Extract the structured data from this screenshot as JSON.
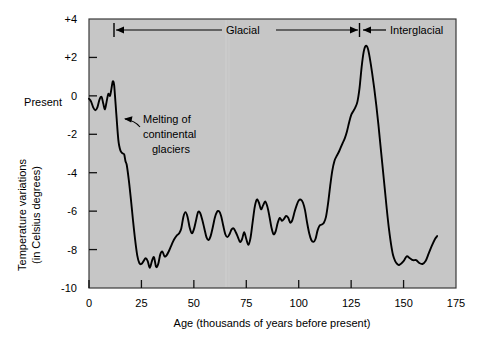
{
  "figure": {
    "plot_background_color": "#c6c6c6",
    "frame_color": "#333333",
    "curve_color": "#000000",
    "present_label": "Present",
    "annotation": {
      "line1": "Melting of",
      "line2": "continental",
      "line3": "glaciers"
    },
    "bands": [
      {
        "label": "Glacial",
        "start": 11,
        "end": 128
      },
      {
        "label": "Interglacial",
        "start": 128,
        "end": 175
      }
    ]
  },
  "chart_data": {
    "type": "line",
    "title": "",
    "xlabel": "Age (thousands of years before present)",
    "ylabel_line1": "Temperature variations",
    "ylabel_line2": "(in Celsius degrees)",
    "xlim": [
      0,
      175
    ],
    "ylim": [
      -10,
      4
    ],
    "xticks": [
      0,
      25,
      50,
      75,
      100,
      125,
      150,
      175
    ],
    "xticklabels": [
      "0",
      "25",
      "50",
      "75",
      "100",
      "125",
      "150",
      "175"
    ],
    "yticks": [
      -10,
      -8,
      -6,
      -4,
      -2,
      0,
      2,
      4
    ],
    "yticklabels": [
      "-10",
      "-8",
      "-6",
      "-4",
      "-2",
      "0",
      "+2",
      "+4"
    ],
    "grid": false,
    "legend": null,
    "series": [
      {
        "name": "Temperature variation",
        "x": [
          0.0,
          1.0,
          2.0,
          3.0,
          4.0,
          5.0,
          6.0,
          6.8,
          7.6,
          8.4,
          9.2,
          10.0,
          10.6,
          11.2,
          11.6,
          12.0,
          12.4,
          12.8,
          13.2,
          13.6,
          14.0,
          14.4,
          15.0,
          15.6,
          16.2,
          16.8,
          17.4,
          18.0,
          19.0,
          20.0,
          21.0,
          22.0,
          23.0,
          24.0,
          25.0,
          26.0,
          27.0,
          28.0,
          29.0,
          30.0,
          31.0,
          32.0,
          33.0,
          34.0,
          35.0,
          36.0,
          37.0,
          38.0,
          39.0,
          40.0,
          41.0,
          42.0,
          43.0,
          44.0,
          45.0,
          46.0,
          47.0,
          48.0,
          49.0,
          50.0,
          51.0,
          52.0,
          53.0,
          54.0,
          55.0,
          56.0,
          57.0,
          58.0,
          59.0,
          60.0,
          61.0,
          62.0,
          63.0,
          64.0,
          65.0,
          66.0,
          67.0,
          68.0,
          69.0,
          70.0,
          71.0,
          72.0,
          73.0,
          74.0,
          75.0,
          76.0,
          77.0,
          78.0,
          79.0,
          80.0,
          81.0,
          82.0,
          83.0,
          84.0,
          85.0,
          86.0,
          87.0,
          88.0,
          89.0,
          90.0,
          91.0,
          92.0,
          93.0,
          94.0,
          95.0,
          96.0,
          97.0,
          98.0,
          99.0,
          100.0,
          101.0,
          102.0,
          103.0,
          104.0,
          105.0,
          106.0,
          107.0,
          108.0,
          109.0,
          110.0,
          111.0,
          112.0,
          113.0,
          114.0,
          115.0,
          116.0,
          117.0,
          118.0,
          119.0,
          120.0,
          121.0,
          122.0,
          123.0,
          124.0,
          125.0,
          126.0,
          127.0,
          128.0,
          129.0,
          130.0,
          131.0,
          132.0,
          133.0,
          134.0,
          135.0,
          136.0,
          137.0,
          138.0,
          139.0,
          140.0,
          141.0,
          142.0,
          143.0,
          144.0,
          145.0,
          146.0,
          147.0,
          148.0,
          150.0,
          151.5,
          153.0,
          154.5,
          156.0,
          157.5,
          159.0,
          160.5,
          162.0,
          163.5,
          165.0,
          166.0
        ],
        "y": [
          -0.15,
          -0.3,
          -0.6,
          -0.75,
          -0.6,
          -0.2,
          -0.05,
          -0.4,
          -0.7,
          -0.3,
          0.1,
          0.0,
          0.3,
          0.7,
          0.75,
          0.55,
          0.0,
          -0.6,
          -1.2,
          -1.8,
          -2.3,
          -2.6,
          -2.85,
          -2.95,
          -3.0,
          -3.05,
          -3.4,
          -3.6,
          -4.4,
          -5.4,
          -6.5,
          -7.5,
          -8.3,
          -8.7,
          -8.75,
          -8.6,
          -8.45,
          -8.6,
          -8.95,
          -8.6,
          -8.4,
          -8.9,
          -8.75,
          -8.25,
          -8.1,
          -8.35,
          -8.3,
          -8.1,
          -7.85,
          -7.6,
          -7.4,
          -7.25,
          -7.15,
          -6.9,
          -6.3,
          -6.05,
          -6.3,
          -6.85,
          -7.15,
          -6.95,
          -6.5,
          -6.05,
          -6.1,
          -6.45,
          -6.9,
          -7.35,
          -7.5,
          -7.3,
          -6.85,
          -6.35,
          -6.05,
          -6.0,
          -6.25,
          -6.75,
          -7.2,
          -7.35,
          -7.2,
          -6.95,
          -6.9,
          -7.1,
          -7.35,
          -7.6,
          -7.45,
          -7.1,
          -7.45,
          -7.75,
          -7.4,
          -6.6,
          -5.8,
          -5.4,
          -5.55,
          -5.9,
          -5.7,
          -5.5,
          -5.75,
          -6.25,
          -6.85,
          -7.2,
          -7.05,
          -6.6,
          -6.35,
          -6.5,
          -6.4,
          -6.25,
          -6.35,
          -6.6,
          -6.45,
          -6.05,
          -5.7,
          -5.45,
          -5.4,
          -5.55,
          -5.95,
          -6.6,
          -7.15,
          -7.5,
          -7.6,
          -7.45,
          -7.0,
          -6.75,
          -6.7,
          -6.6,
          -6.3,
          -5.6,
          -4.7,
          -3.9,
          -3.4,
          -3.15,
          -2.95,
          -2.7,
          -2.45,
          -2.2,
          -1.85,
          -1.4,
          -1.0,
          -0.8,
          -0.6,
          -0.3,
          0.4,
          1.5,
          2.3,
          2.6,
          2.45,
          1.9,
          1.2,
          0.4,
          -0.5,
          -1.5,
          -2.6,
          -3.7,
          -4.8,
          -5.9,
          -6.9,
          -7.7,
          -8.3,
          -8.6,
          -8.75,
          -8.8,
          -8.6,
          -8.35,
          -8.45,
          -8.55,
          -8.55,
          -8.7,
          -8.75,
          -8.6,
          -8.2,
          -7.8,
          -7.45,
          -7.3
        ]
      }
    ]
  }
}
